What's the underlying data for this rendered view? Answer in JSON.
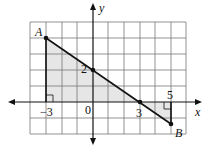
{
  "diagram": {
    "type": "coordinate-plane",
    "axes": {
      "x_label": "x",
      "y_label": "y"
    },
    "grid": {
      "x_range": [
        -4,
        6
      ],
      "y_range": [
        -2,
        5
      ]
    },
    "points": [
      {
        "name": "A",
        "x": -3,
        "y": 4
      },
      {
        "name": "B",
        "x": 5,
        "y": -2
      }
    ],
    "intercepts": [
      {
        "label": "2",
        "x": 0,
        "y": 2
      },
      {
        "label": "3",
        "x": 3,
        "y": 0
      }
    ],
    "tick_labels": {
      "neg3": "−3",
      "zero": "0",
      "three": "3",
      "five": "5",
      "two": "2"
    },
    "labels": {
      "A": "A",
      "B": "B",
      "x": "x",
      "y": "y"
    },
    "colors": {
      "shade": "#e6e6e6",
      "grid": "#777777",
      "line": "#111111"
    }
  }
}
